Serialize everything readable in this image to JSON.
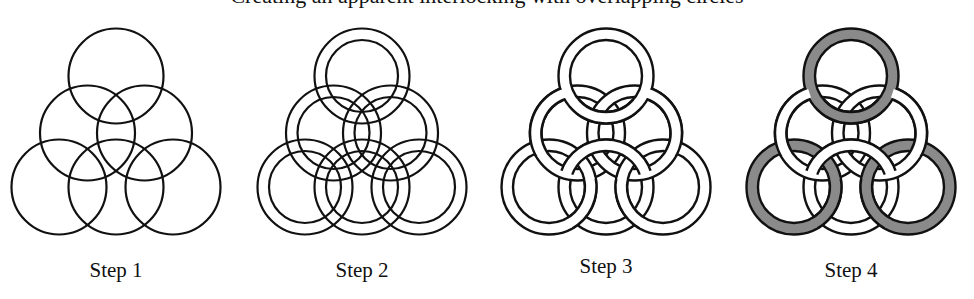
{
  "caption": {
    "text": "Creating an apparent interlocking with overlapping circles",
    "note": "partially clipped at top edge"
  },
  "colors": {
    "stroke": "#111111",
    "band": "#ffffff",
    "highlight": "#8a8a8a",
    "background": "#ffffff"
  },
  "steps": [
    {
      "label": "Step 1",
      "cx": 116,
      "label_y": 258,
      "style": "outline"
    },
    {
      "label": "Step 2",
      "cx": 362,
      "label_y": 258,
      "style": "double-outline"
    },
    {
      "label": "Step 3",
      "cx": 606,
      "label_y": 254,
      "style": "woven"
    },
    {
      "label": "Step 4",
      "cx": 851,
      "label_y": 258,
      "style": "woven-shaded"
    }
  ],
  "geometry": {
    "outer_radius": 47.5,
    "inner_radius": 36,
    "ring_offsets": [
      [
        0,
        76
      ],
      [
        -28.5,
        133
      ],
      [
        28.5,
        133
      ],
      [
        -57,
        187
      ],
      [
        0,
        187
      ],
      [
        57,
        187
      ]
    ]
  }
}
